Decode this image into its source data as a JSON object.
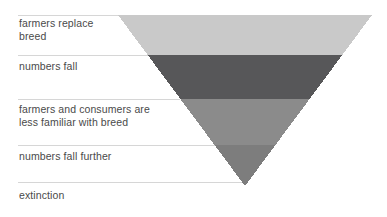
{
  "diagram": {
    "type": "inverted-triangle-funnel",
    "title": "",
    "background_color": "#ffffff",
    "separator_color": "#d6d6d6",
    "text_color": "#4a4a4a",
    "apex": {
      "x": 245,
      "y": 186
    },
    "top_left": {
      "x": 118,
      "y": 15
    },
    "top_right": {
      "x": 372,
      "y": 15
    },
    "stages": [
      {
        "index": 0,
        "label": "farmers replace\nbreed",
        "band_color": "#c9c9c9",
        "band_top": 15,
        "band_bottom": 55,
        "separator_y": 15,
        "caption_y": 17
      },
      {
        "index": 1,
        "label": "numbers fall",
        "band_color": "#575759",
        "band_top": 55,
        "band_bottom": 99,
        "separator_y": 55,
        "caption_y": 60
      },
      {
        "index": 2,
        "label": "farmers and consumers are\nless familiar with breed",
        "band_color": "#8b8b8b",
        "band_top": 99,
        "band_bottom": 145,
        "separator_y": 99,
        "caption_y": 103
      },
      {
        "index": 3,
        "label": "numbers fall further",
        "band_color": "#7d7d7d",
        "band_top": 145,
        "band_bottom": 186,
        "separator_y": 145,
        "caption_y": 150
      },
      {
        "index": 4,
        "label": "extinction",
        "band_color": "",
        "band_top": 186,
        "band_bottom": 186,
        "separator_y": 182,
        "caption_y": 189
      }
    ]
  }
}
